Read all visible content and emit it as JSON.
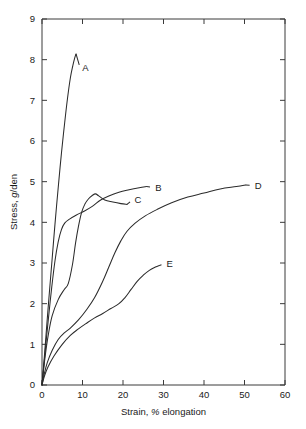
{
  "chart_data": {
    "type": "line",
    "title": "",
    "xlabel": "Strain, % elongation",
    "ylabel": "Stress, g/den",
    "xlim": [
      0,
      60
    ],
    "ylim": [
      0,
      9
    ],
    "xticks": [
      0,
      10,
      20,
      30,
      40,
      50,
      60
    ],
    "yticks": [
      0,
      1,
      2,
      3,
      4,
      5,
      6,
      7,
      8,
      9
    ],
    "xtick_labels": [
      "0",
      "10",
      "20",
      "30",
      "40",
      "50",
      "60"
    ],
    "ytick_labels": [
      "0",
      "1",
      "2",
      "3",
      "4",
      "5",
      "6",
      "7",
      "8",
      "9"
    ],
    "grid": false,
    "legend": "inline-end-labels",
    "line_color": "#2b2b2b",
    "series": [
      {
        "name": "A",
        "label": "A",
        "label_x": 9.4,
        "label_y": 7.8,
        "points": [
          [
            0.0,
            0.0
          ],
          [
            0.3,
            0.35
          ],
          [
            0.7,
            0.85
          ],
          [
            1.2,
            1.5
          ],
          [
            1.8,
            2.25
          ],
          [
            2.5,
            3.1
          ],
          [
            3.2,
            3.95
          ],
          [
            4.0,
            4.85
          ],
          [
            4.8,
            5.7
          ],
          [
            5.6,
            6.45
          ],
          [
            6.3,
            7.05
          ],
          [
            7.0,
            7.55
          ],
          [
            7.6,
            7.85
          ],
          [
            8.1,
            8.05
          ],
          [
            8.4,
            8.14
          ]
        ]
      },
      {
        "name": "B",
        "label": "B",
        "label_x": 27.4,
        "label_y": 4.86,
        "points": [
          [
            0.0,
            0.0
          ],
          [
            0.4,
            0.42
          ],
          [
            0.9,
            0.95
          ],
          [
            1.6,
            1.65
          ],
          [
            2.4,
            2.4
          ],
          [
            3.2,
            3.05
          ],
          [
            4.0,
            3.52
          ],
          [
            4.8,
            3.82
          ],
          [
            5.6,
            3.98
          ],
          [
            6.8,
            4.08
          ],
          [
            8.5,
            4.18
          ],
          [
            10.5,
            4.28
          ],
          [
            12.5,
            4.4
          ],
          [
            14.5,
            4.55
          ],
          [
            16.5,
            4.65
          ],
          [
            19.0,
            4.74
          ],
          [
            21.5,
            4.8
          ],
          [
            24.0,
            4.85
          ],
          [
            25.8,
            4.88
          ]
        ]
      },
      {
        "name": "C",
        "label": "C",
        "label_x": 22.3,
        "label_y": 4.55,
        "points": [
          [
            0.0,
            0.0
          ],
          [
            0.3,
            0.3
          ],
          [
            0.8,
            0.72
          ],
          [
            1.5,
            1.2
          ],
          [
            2.5,
            1.7
          ],
          [
            4.0,
            2.1
          ],
          [
            5.5,
            2.35
          ],
          [
            6.5,
            2.5
          ],
          [
            7.5,
            2.95
          ],
          [
            8.3,
            3.5
          ],
          [
            9.0,
            3.9
          ],
          [
            9.8,
            4.25
          ],
          [
            10.6,
            4.45
          ],
          [
            11.5,
            4.58
          ],
          [
            12.4,
            4.66
          ],
          [
            13.2,
            4.7
          ],
          [
            14.0,
            4.65
          ],
          [
            15.5,
            4.55
          ],
          [
            17.5,
            4.5
          ],
          [
            19.5,
            4.46
          ],
          [
            21.0,
            4.44
          ]
        ]
      },
      {
        "name": "D",
        "label": "D",
        "label_x": 52.0,
        "label_y": 4.91,
        "points": [
          [
            0.0,
            0.0
          ],
          [
            0.5,
            0.25
          ],
          [
            1.3,
            0.55
          ],
          [
            2.5,
            0.85
          ],
          [
            4.0,
            1.12
          ],
          [
            5.5,
            1.28
          ],
          [
            7.0,
            1.4
          ],
          [
            9.0,
            1.6
          ],
          [
            11.0,
            1.85
          ],
          [
            13.0,
            2.15
          ],
          [
            15.0,
            2.55
          ],
          [
            16.5,
            2.9
          ],
          [
            18.0,
            3.25
          ],
          [
            19.5,
            3.55
          ],
          [
            21.0,
            3.78
          ],
          [
            23.0,
            3.98
          ],
          [
            25.5,
            4.16
          ],
          [
            28.5,
            4.32
          ],
          [
            32.0,
            4.48
          ],
          [
            36.0,
            4.62
          ],
          [
            40.0,
            4.72
          ],
          [
            44.0,
            4.82
          ],
          [
            48.0,
            4.88
          ],
          [
            50.3,
            4.92
          ]
        ]
      },
      {
        "name": "E",
        "label": "E",
        "label_x": 30.2,
        "label_y": 2.98,
        "points": [
          [
            0.0,
            0.0
          ],
          [
            0.6,
            0.22
          ],
          [
            1.5,
            0.45
          ],
          [
            3.0,
            0.72
          ],
          [
            5.0,
            1.0
          ],
          [
            7.0,
            1.22
          ],
          [
            9.0,
            1.38
          ],
          [
            11.0,
            1.52
          ],
          [
            13.0,
            1.65
          ],
          [
            15.0,
            1.76
          ],
          [
            17.0,
            1.88
          ],
          [
            19.0,
            2.0
          ],
          [
            20.5,
            2.15
          ],
          [
            22.0,
            2.35
          ],
          [
            23.5,
            2.55
          ],
          [
            25.0,
            2.7
          ],
          [
            26.5,
            2.82
          ],
          [
            28.0,
            2.9
          ],
          [
            29.0,
            2.94
          ]
        ]
      }
    ]
  },
  "axes": {
    "y_title_text": "Stress, ",
    "y_title_italic": "g",
    "y_title_tail": "/den",
    "x_title_head": "Strain, ",
    "x_title_italic": "%",
    "x_title_tail": " elongation"
  }
}
